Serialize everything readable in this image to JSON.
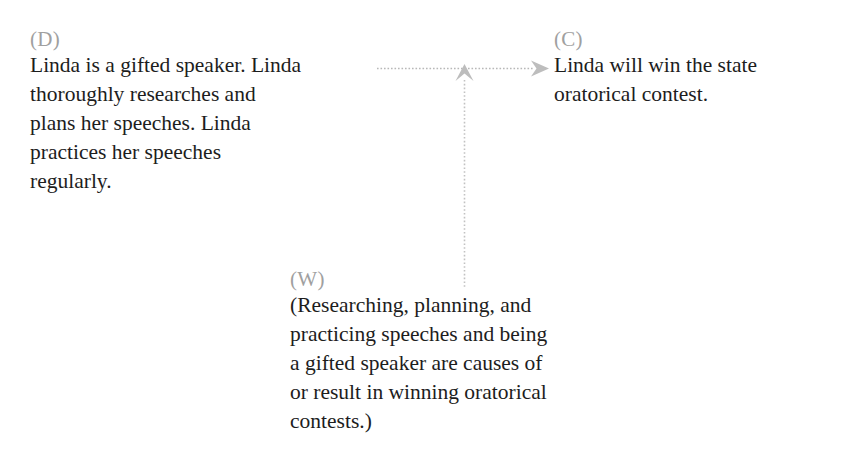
{
  "diagram": {
    "type": "toulmin-argument-model",
    "background_color": "#ffffff",
    "text_color": "#1d1d1d",
    "label_color": "#a0a0a0",
    "connector_color": "#b3b3b3",
    "nodes": {
      "data": {
        "label": "(D)",
        "text": "Linda is a gifted speaker. Linda\nthoroughly researches and\nplans her speeches. Linda\npractices her speeches\nregularly."
      },
      "claim": {
        "label": "(C)",
        "text": "Linda will win the state\noratorical contest."
      },
      "warrant": {
        "label": "(W)",
        "text": "(Researching, planning, and\npracticing speeches and being\na gifted speaker are causes of\nor result in winning oratorical\ncontests.)"
      }
    },
    "connectors": [
      {
        "name": "data-to-claim-arrow",
        "from": "data",
        "to": "claim",
        "orientation": "horizontal",
        "style": "dotted",
        "arrowhead": "right"
      },
      {
        "name": "warrant-to-link-arrow",
        "from": "warrant",
        "to": "data-to-claim-arrow",
        "orientation": "vertical",
        "style": "dotted",
        "arrowhead": "up"
      }
    ]
  }
}
